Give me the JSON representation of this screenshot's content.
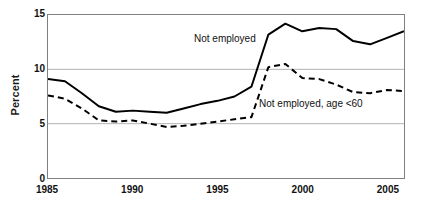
{
  "chart_data": {
    "type": "line",
    "title": "",
    "subtitle": "",
    "xlabel": "",
    "ylabel": "Percent",
    "xlim": [
      1985,
      2006
    ],
    "ylim": [
      0,
      15
    ],
    "yticks": [
      0,
      5,
      10,
      15
    ],
    "ytick_labels": [
      "0",
      "5",
      "10",
      "15"
    ],
    "xticks": [
      1985,
      1990,
      1995,
      2000,
      2005
    ],
    "xtick_labels": [
      "1985",
      "1990",
      "1995",
      "2000",
      "2005"
    ],
    "grid": "horizontal-only",
    "gridlines_at": [
      5,
      10
    ],
    "legend_position": "inline-annotations",
    "x": [
      1985,
      1986,
      1987,
      1988,
      1989,
      1990,
      1991,
      1992,
      1993,
      1994,
      1995,
      1996,
      1997,
      1998,
      1999,
      2000,
      2001,
      2002,
      2003,
      2004,
      2005,
      2006
    ],
    "series": [
      {
        "name": "Not employed",
        "style": "solid",
        "color": "#000000",
        "values": [
          9.1,
          8.9,
          7.8,
          6.6,
          6.1,
          6.2,
          6.1,
          6.0,
          6.4,
          6.8,
          7.1,
          7.5,
          8.4,
          13.2,
          14.2,
          13.5,
          13.8,
          13.7,
          12.6,
          12.3,
          12.9,
          13.5
        ]
      },
      {
        "name": "Not employed, age <60",
        "style": "dashed",
        "color": "#000000",
        "values": [
          7.6,
          7.3,
          6.4,
          5.3,
          5.2,
          5.3,
          5.0,
          4.7,
          4.8,
          5.0,
          5.2,
          5.4,
          5.6,
          10.2,
          10.5,
          9.2,
          9.1,
          8.6,
          7.9,
          7.8,
          8.1,
          8.0
        ]
      }
    ],
    "annotations": [
      {
        "text": "Not employed",
        "series": "Not employed"
      },
      {
        "text": "Not employed, age <60",
        "series": "Not employed, age <60"
      }
    ]
  },
  "axes": {
    "y_title": "Percent"
  },
  "colors": {
    "line": "#000000",
    "frame": "#808080",
    "gridline": "#b3b3b3",
    "text": "#111111",
    "background": "#ffffff"
  }
}
